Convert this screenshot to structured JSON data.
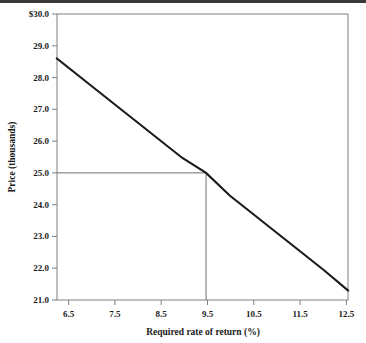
{
  "figure": {
    "top_rule_color": "#3a3a3a",
    "background_color": "#ffffff",
    "frame_color": "#808080",
    "series_color": "#1a1a1a",
    "reference_color": "#6e6e6e"
  },
  "chart_data": {
    "type": "line",
    "title": "",
    "xlabel": "Required rate of return (%)",
    "ylabel": "Price (thousands)",
    "xlim": [
      6.35,
      12.5
    ],
    "ylim": [
      21.0,
      30.0
    ],
    "grid": false,
    "legend": "none",
    "xticks": [
      6.5,
      7.5,
      8.5,
      9.5,
      10.5,
      11.5,
      12.5
    ],
    "xtick_labels": [
      "6.5",
      "7.5",
      "8.5",
      "9.5",
      "10.5",
      "11.5",
      "12.5"
    ],
    "yticks": [
      21.0,
      22.0,
      23.0,
      24.0,
      25.0,
      26.0,
      27.0,
      28.0,
      29.0,
      30.0
    ],
    "ytick_labels": [
      "21.0",
      "22.0",
      "23.0",
      "24.0",
      "25.0",
      "26.0",
      "27.0",
      "28.0",
      "29.0",
      "$30.0"
    ],
    "series": [
      {
        "name": "Price vs required rate of return",
        "x": [
          6.35,
          7.0,
          7.5,
          8.0,
          8.5,
          9.0,
          9.5,
          10.0,
          10.5,
          11.0,
          11.5,
          12.0,
          12.5
        ],
        "values": [
          28.6,
          27.83,
          27.24,
          26.65,
          26.06,
          25.47,
          25.0,
          24.29,
          23.7,
          23.11,
          22.52,
          21.93,
          21.3
        ]
      }
    ],
    "annotations": [
      {
        "name": "reference-price",
        "type": "horizontal-line",
        "y": 25.0,
        "x_from": 6.35,
        "x_to": 9.5,
        "label": "25.0"
      },
      {
        "name": "reference-rate",
        "type": "vertical-line",
        "x": 9.5,
        "y_from": 21.0,
        "y_to": 25.0,
        "label": "9.5"
      }
    ]
  }
}
